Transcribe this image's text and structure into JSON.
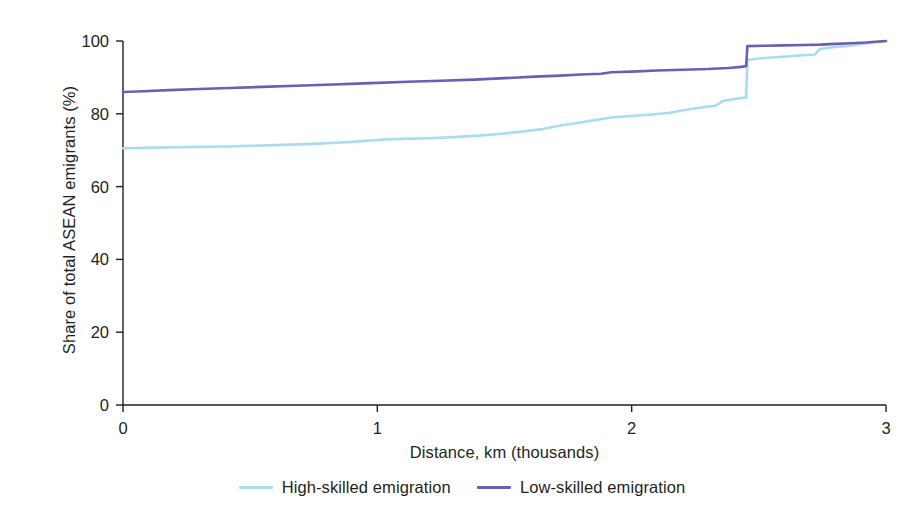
{
  "chart_data": {
    "type": "line",
    "title": "",
    "subtitle": "",
    "xlabel": "Distance, km (thousands)",
    "ylabel": "Share of total ASEAN emigrants (%)",
    "xlim": [
      0,
      3
    ],
    "ylim": [
      0,
      100
    ],
    "xticks": [
      0,
      1,
      2,
      3
    ],
    "xtick_labels": [
      "0",
      "1",
      "2",
      "3"
    ],
    "yticks": [
      0,
      20,
      40,
      60,
      80,
      100
    ],
    "ytick_labels": [
      "0",
      "20",
      "40",
      "60",
      "80",
      "100"
    ],
    "grid": false,
    "legend_position": "bottom-center",
    "series": [
      {
        "name": "High-skilled emigration",
        "color": "#a9dcf1",
        "x": [
          0.0,
          0.05,
          0.12,
          0.2,
          0.3,
          0.4,
          0.5,
          0.6,
          0.7,
          0.8,
          0.9,
          1.0,
          1.05,
          1.1,
          1.2,
          1.3,
          1.4,
          1.5,
          1.58,
          1.65,
          1.72,
          1.78,
          1.85,
          1.92,
          2.0,
          2.08,
          2.15,
          2.22,
          2.28,
          2.33,
          2.36,
          2.4,
          2.43,
          2.45,
          2.455,
          2.5,
          2.58,
          2.66,
          2.72,
          2.74,
          2.78,
          2.84,
          2.9,
          2.95,
          3.0
        ],
        "y": [
          70.5,
          70.6,
          70.7,
          70.8,
          70.9,
          71.0,
          71.2,
          71.4,
          71.6,
          71.9,
          72.3,
          72.8,
          73.0,
          73.1,
          73.3,
          73.6,
          74.0,
          74.6,
          75.2,
          75.8,
          76.8,
          77.4,
          78.2,
          79.0,
          79.4,
          79.8,
          80.3,
          81.2,
          81.8,
          82.2,
          83.6,
          84.0,
          84.3,
          84.5,
          94.8,
          95.2,
          95.6,
          96.0,
          96.3,
          97.8,
          98.2,
          98.6,
          99.1,
          99.6,
          100.0
        ]
      },
      {
        "name": "Low-skilled emigration",
        "color": "#6b5fb5",
        "x": [
          0.0,
          0.08,
          0.18,
          0.3,
          0.42,
          0.55,
          0.68,
          0.8,
          0.92,
          1.0,
          1.12,
          1.25,
          1.38,
          1.5,
          1.62,
          1.72,
          1.8,
          1.88,
          1.92,
          2.0,
          2.1,
          2.2,
          2.3,
          2.38,
          2.43,
          2.45,
          2.455,
          2.52,
          2.6,
          2.68,
          2.74,
          2.8,
          2.86,
          2.92,
          2.96,
          3.0
        ],
        "y": [
          86.0,
          86.2,
          86.5,
          86.8,
          87.1,
          87.4,
          87.7,
          88.0,
          88.3,
          88.5,
          88.8,
          89.1,
          89.4,
          89.8,
          90.2,
          90.5,
          90.8,
          91.0,
          91.4,
          91.6,
          91.9,
          92.1,
          92.3,
          92.6,
          92.9,
          93.1,
          98.6,
          98.7,
          98.8,
          98.9,
          99.0,
          99.2,
          99.4,
          99.6,
          99.8,
          100.0
        ]
      }
    ]
  },
  "legend": {
    "items": [
      {
        "label": "High-skilled emigration",
        "color": "#a9dcf1"
      },
      {
        "label": "Low-skilled emigration",
        "color": "#6b5fb5"
      }
    ]
  },
  "axes": {
    "color": "#231f20"
  }
}
